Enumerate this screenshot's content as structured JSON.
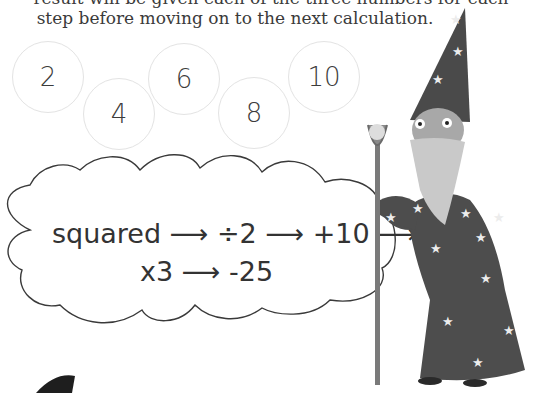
{
  "instructions": {
    "line1": "result will be given each of the three numbers for each",
    "line2": "step before moving on to the next calculation."
  },
  "numbers": [
    {
      "value": "2"
    },
    {
      "value": "4"
    },
    {
      "value": "6"
    },
    {
      "value": "8"
    },
    {
      "value": "10"
    }
  ],
  "cloud": {
    "line1": "squared ⟶ ÷2 ⟶ +10 ⟶",
    "line2": "x3 ⟶ -25"
  },
  "illustration": {
    "character": "wizard-with-staff",
    "colors": {
      "robe": "#4a4a4a",
      "stars": "#e8e8e8",
      "beard": "#bdbdbd",
      "staff": "#777777"
    }
  }
}
